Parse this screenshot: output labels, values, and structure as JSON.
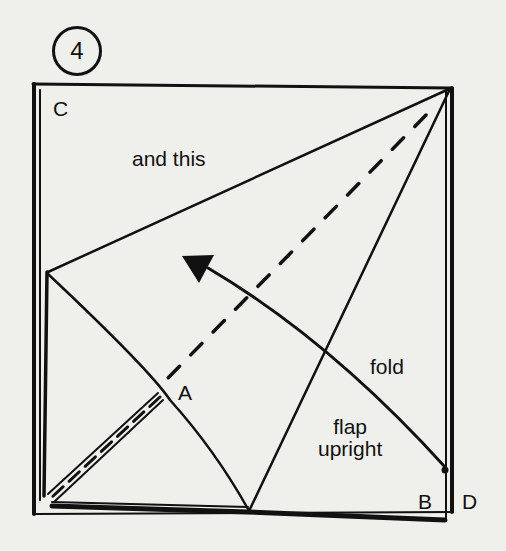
{
  "step": {
    "number": "4"
  },
  "labels": {
    "corner_c": "C",
    "corner_a": "A",
    "corner_b": "B",
    "corner_d": "D",
    "and_this": "and this",
    "fold": "fold",
    "flap_line1": "flap",
    "flap_line2": "upright"
  },
  "colors": {
    "ink": "#111111",
    "paper": "#efefec"
  },
  "legend": {
    "dashed_line": "valley-fold-line",
    "arrow": "fold-direction-arrow"
  }
}
